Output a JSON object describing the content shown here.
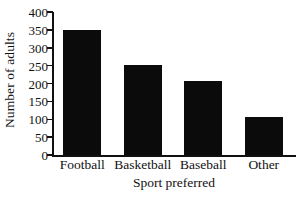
{
  "chart_data": {
    "type": "bar",
    "title": "",
    "subtitle": "",
    "xlabel": "Sport preferred",
    "ylabel": "Number of adults",
    "categories": [
      "Football",
      "Basketball",
      "Baseball",
      "Other"
    ],
    "values": [
      350,
      253,
      208,
      105
    ],
    "ylim": [
      0,
      400
    ],
    "ytick_values": [
      0,
      50,
      100,
      150,
      200,
      250,
      300,
      350,
      400
    ],
    "ytick_labels": [
      "0",
      "50",
      "100",
      "150",
      "200",
      "250",
      "300",
      "350",
      "400"
    ],
    "grid": false,
    "legend": false,
    "legend_position": "none",
    "bar_color": "#0b0b0b",
    "axis_color": "#111111",
    "background_color": "#ffffff"
  }
}
